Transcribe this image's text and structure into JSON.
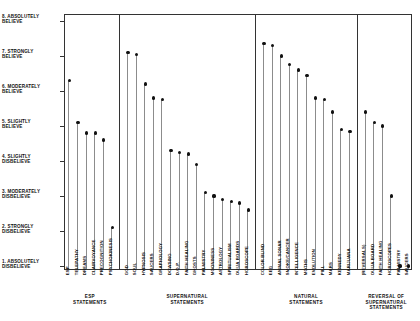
{
  "chart_data": {
    "type": "scatter",
    "title": "",
    "xlabel": "",
    "ylabel": "",
    "ylim": [
      1,
      8
    ],
    "grid": false,
    "legend": "none",
    "y_scale_labels": [
      {
        "value": 8,
        "label": "8. ABSOLUTELY BELIEVE"
      },
      {
        "value": 7,
        "label": "7. STRONGLY BELIEVE"
      },
      {
        "value": 6,
        "label": "6. MODERATELY BELIEVE"
      },
      {
        "value": 5,
        "label": "5. SLIGHTLY BELIEVE"
      },
      {
        "value": 4,
        "label": "4. SLIGHTLY DISBELIEVE"
      },
      {
        "value": 3,
        "label": "3. MODERATELY DISBELIEVE"
      },
      {
        "value": 2,
        "label": "2. STRONGLY DISBELIEVE"
      },
      {
        "value": 1,
        "label": "1. ABSOLUTELY DISBELIEVE"
      }
    ],
    "groups": [
      {
        "caption": "ESP\nSTATEMENTS",
        "caption_lines": [
          "ESP",
          "STATEMENTS"
        ],
        "categories": [
          "ESP",
          "TELEPATHY",
          "DREAMS",
          "CLAIRVOYANCE",
          "PRECOGNITION",
          "PSYCHOKINESIS"
        ],
        "values": [
          6.3,
          5.1,
          4.8,
          4.8,
          4.6,
          2.1
        ]
      },
      {
        "caption": "SUPERNATURAL\nSTATEMENTS",
        "caption_lines": [
          "SUPERNATURAL",
          "STATEMENTS"
        ],
        "categories": [
          "GOD",
          "SOUL",
          "HYPNOSIS",
          "SAUCERS",
          "GRAPHOLOGY",
          "DOWSING",
          "D.O.P.",
          "FAITH HEALING",
          "GHOSTS",
          "PALMISTRY",
          "MOONINESS",
          "ASTROLOGY",
          "SPIRITUALISM",
          "OUIJA BOARDS",
          "HOROSCOPE"
        ],
        "values": [
          7.1,
          7.05,
          6.2,
          5.8,
          5.75,
          4.3,
          4.25,
          4.2,
          3.9,
          3.1,
          3.0,
          2.9,
          2.85,
          2.8,
          2.6
        ]
      },
      {
        "caption": "NATURAL\nSTATEMENTS",
        "caption_lines": [
          "NATURAL",
          "STATEMENTS"
        ],
        "categories": [
          "COLOR BLIND",
          "EEG",
          "ANIMAL SONAR",
          "SMOKE/CANCER",
          "INTELLIGENCE",
          "MOTHS",
          "EVOLUTION",
          "PILL",
          "MARS",
          "KENNEDY",
          "MARIJUANA"
        ],
        "values": [
          7.35,
          7.3,
          7.0,
          6.75,
          6.6,
          6.45,
          5.8,
          5.75,
          5.4,
          4.9,
          4.85
        ]
      },
      {
        "caption": "REVERSAL OF\nSUPERNATURAL\nSTATEMENTS",
        "caption_lines": [
          "REVERSAL OF",
          "SUPERNATURAL",
          "STATEMENTS"
        ],
        "categories": [
          "(REVERSALS)",
          "OUIJA BOARD",
          "FAITH HEALING",
          "HOROSCOPES",
          "PALMISTRY",
          "SAUCERS"
        ],
        "values": [
          5.4,
          5.1,
          5.0,
          3.0,
          1.0,
          1.0
        ]
      }
    ],
    "colors": {
      "axis": "#333333",
      "stem": "#8c8c8c",
      "marker": "#111111",
      "background": "#ffffff"
    }
  }
}
